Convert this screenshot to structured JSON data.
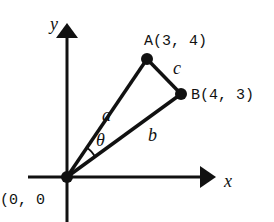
{
  "diagram": {
    "axes": {
      "x_label": "x",
      "y_label": "y"
    },
    "points": {
      "origin": {
        "label": "(0, 0",
        "coords": [
          0,
          0
        ]
      },
      "A": {
        "label": "A(3, 4)",
        "coords": [
          3,
          4
        ]
      },
      "B": {
        "label": "B(4, 3)",
        "coords": [
          4,
          3
        ]
      }
    },
    "segments": {
      "a": "a",
      "b": "b",
      "c": "c"
    },
    "angle_label": "θ",
    "colors": {
      "stroke": "#111111",
      "background": "#ffffff"
    }
  }
}
